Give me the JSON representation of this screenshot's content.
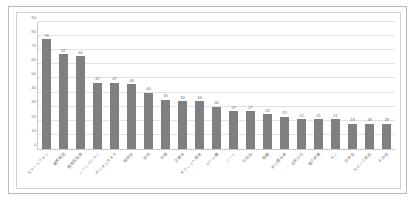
{
  "chart_data": {
    "type": "bar",
    "title": "",
    "xlabel": "",
    "ylabel": "",
    "ylim": [
      0,
      90
    ],
    "yticks": [
      0,
      10,
      20,
      30,
      40,
      50,
      60,
      70,
      80,
      90
    ],
    "grid": true,
    "legend": false,
    "bar_color": "#808080",
    "categories": [
      "スマートフォン",
      "携帯電話",
      "携帯型音楽",
      "ノートパソコン",
      "デジタルカメラ",
      "腕時計",
      "財布",
      "手帳",
      "文庫本",
      "タブレット端末",
      "ゲーム機",
      "ノート",
      "化粧品",
      "眼鏡",
      "折り畳み傘",
      "名刺入れ",
      "電子辞書",
      "ペン",
      "お弁当",
      "スポーツ用品",
      "その他"
    ],
    "values": [
      78,
      67,
      66,
      47,
      47,
      46,
      40,
      35,
      34,
      34,
      30,
      27,
      27,
      25,
      23,
      21,
      21,
      21,
      18,
      18,
      18
    ]
  }
}
